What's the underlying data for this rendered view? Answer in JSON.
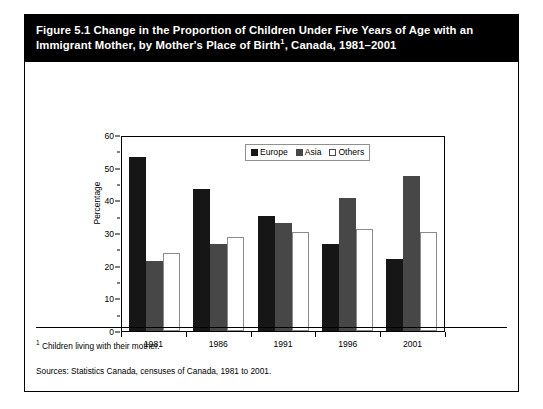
{
  "figure": {
    "title_line1": "Figure 5.1 Change in the Proportion of Children Under Five Years of Age with an",
    "title_line2_pre": "Immigrant Mother, by Mother's Place of Birth",
    "title_footnote_marker": "1",
    "title_line2_post": ", Canada, 1981–2001",
    "footnote_marker": "1",
    "footnote_text": "Children living with their mother.",
    "sources": "Sources: Statistics Canada, censuses of Canada, 1981 to 2001."
  },
  "chart_data": {
    "type": "bar",
    "xlabel": "",
    "ylabel": "Percentage",
    "categories": [
      "1981",
      "1986",
      "1991",
      "1996",
      "2001"
    ],
    "ylim": [
      0,
      60
    ],
    "yticks": [
      0,
      10,
      20,
      30,
      40,
      50,
      60
    ],
    "ytick_labels": [
      "0",
      "10",
      "20",
      "30",
      "40",
      "50",
      "60"
    ],
    "yminor_step": 5,
    "grid": false,
    "legend_position": "top-center-inside",
    "series": [
      {
        "name": "Europe",
        "color": "#161616",
        "values": [
          53.9,
          44.0,
          35.5,
          27.0,
          22.3
        ]
      },
      {
        "name": "Asia",
        "color": "#474747",
        "values": [
          21.7,
          27.0,
          33.4,
          41.0,
          47.8
        ]
      },
      {
        "name": "Others",
        "color": "#ffffff",
        "values": [
          24.2,
          29.0,
          30.6,
          31.5,
          30.6
        ]
      }
    ]
  }
}
